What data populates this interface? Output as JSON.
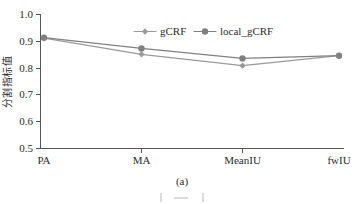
{
  "figure": {
    "caption": "(a)",
    "background_color": "#ffffff",
    "axis_color": "#555555",
    "text_color": "#2b2b2b"
  },
  "chart_data": {
    "type": "line",
    "title": "",
    "subtitle": "",
    "xlabel": "",
    "ylabel": "分割指标值",
    "categories": [
      "PA",
      "MA",
      "MeanIU",
      "fwIU"
    ],
    "series": [
      {
        "name": "gCRF",
        "values": [
          0.91,
          0.85,
          0.808,
          0.845
        ],
        "color": "#9a9a9a",
        "marker": "diamond"
      },
      {
        "name": "local_gCRF",
        "values": [
          0.912,
          0.872,
          0.835,
          0.845
        ],
        "color": "#808080",
        "marker": "circle"
      }
    ],
    "ylim": [
      0.5,
      1.0
    ],
    "yticks": [
      "0.5",
      "0.6",
      "0.7",
      "0.8",
      "0.9",
      "1.0"
    ],
    "ytick_values": [
      0.5,
      0.6,
      0.7,
      0.8,
      0.9,
      1.0
    ],
    "grid": false,
    "legend_position": "top-center",
    "legend": [
      "gCRF",
      "local_gCRF"
    ]
  }
}
